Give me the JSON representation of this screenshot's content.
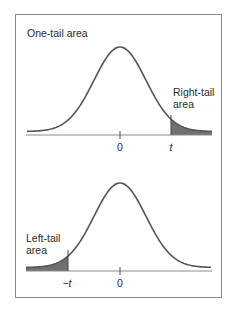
{
  "figure": {
    "title": "One-tail area",
    "colors": {
      "frame": "#8a8a8a",
      "curve": "#555555",
      "axis": "#8a8a8a",
      "shading": "#707070",
      "text": "#2a2a2a"
    },
    "panels": [
      {
        "id": "right-tail",
        "area_label_line1": "Right-tail",
        "area_label_line2": "area",
        "ticks": [
          {
            "label": "0",
            "x": 120
          },
          {
            "label": "t",
            "x": 171
          }
        ],
        "shaded_region": "right"
      },
      {
        "id": "left-tail",
        "area_label_line1": "Left-tail",
        "area_label_line2": "area",
        "ticks": [
          {
            "label": "−t",
            "x": 68
          },
          {
            "label": "0",
            "x": 120
          }
        ],
        "shaded_region": "left"
      }
    ]
  }
}
